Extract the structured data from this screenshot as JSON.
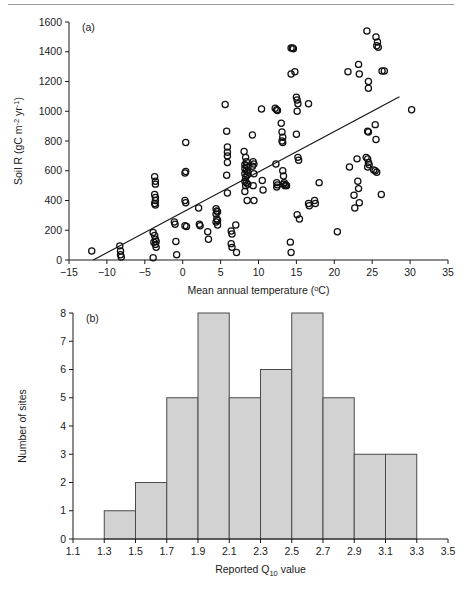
{
  "figure": {
    "panels": [
      "(a)",
      "(b)"
    ]
  },
  "chart_data": [
    {
      "type": "scatter",
      "panel": "(a)",
      "title": "",
      "xlabel": "Mean annual temperature (°C)",
      "ylabel": "Soil R (gC m⁻² yr⁻¹)",
      "ylabel_parts": {
        "main": "Soil R (gC m",
        "sup1": "-2",
        "mid": " yr",
        "sup2": "-1",
        "end": ")"
      },
      "xlabel_parts": {
        "main": "Mean annual temperature (",
        "deg": "o",
        "end": "C)"
      },
      "xlim": [
        -15,
        35
      ],
      "ylim": [
        0,
        1600
      ],
      "xticks": [
        -15,
        -10,
        -5,
        0,
        5,
        10,
        15,
        20,
        25,
        30,
        35
      ],
      "xtick_labels": [
        "−15",
        "−10",
        "−5",
        "0",
        "5",
        "10",
        "15",
        "20",
        "25",
        "30",
        "35"
      ],
      "yticks": [
        0,
        200,
        400,
        600,
        800,
        1000,
        1200,
        1400,
        1600
      ],
      "ytick_labels": [
        "0",
        "200",
        "400",
        "600",
        "800",
        "1000",
        "1200",
        "1400",
        "1600"
      ],
      "grid": false,
      "legend": "none",
      "marker": "open-circle",
      "trendline": {
        "x": [
          -11.8,
          28.6
        ],
        "y": [
          0,
          1098
        ]
      },
      "points": [
        [
          -12.0,
          60
        ],
        [
          -8.3,
          95
        ],
        [
          -8.2,
          60
        ],
        [
          -8.2,
          35
        ],
        [
          -8.1,
          20
        ],
        [
          -3.7,
          560
        ],
        [
          -3.6,
          530
        ],
        [
          -3.6,
          510
        ],
        [
          -3.7,
          440
        ],
        [
          -3.6,
          420
        ],
        [
          -3.6,
          400
        ],
        [
          -3.7,
          380
        ],
        [
          -3.6,
          370
        ],
        [
          -3.9,
          185
        ],
        [
          -3.7,
          165
        ],
        [
          -3.6,
          140
        ],
        [
          -3.5,
          125
        ],
        [
          -3.8,
          120
        ],
        [
          -3.6,
          105
        ],
        [
          -3.5,
          85
        ],
        [
          -3.9,
          15
        ],
        [
          -1.1,
          255
        ],
        [
          -1.0,
          240
        ],
        [
          -0.9,
          125
        ],
        [
          -0.8,
          35
        ],
        [
          0.4,
          790
        ],
        [
          0.4,
          595
        ],
        [
          0.3,
          585
        ],
        [
          0.3,
          400
        ],
        [
          0.4,
          385
        ],
        [
          0.3,
          230
        ],
        [
          0.5,
          225
        ],
        [
          2.1,
          350
        ],
        [
          2.2,
          240
        ],
        [
          2.3,
          230
        ],
        [
          3.3,
          190
        ],
        [
          3.4,
          140
        ],
        [
          4.4,
          345
        ],
        [
          4.5,
          330
        ],
        [
          4.6,
          325
        ],
        [
          4.4,
          310
        ],
        [
          4.5,
          275
        ],
        [
          4.6,
          265
        ],
        [
          4.4,
          255
        ],
        [
          4.6,
          235
        ],
        [
          5.6,
          1045
        ],
        [
          5.8,
          865
        ],
        [
          5.9,
          760
        ],
        [
          5.9,
          725
        ],
        [
          5.9,
          700
        ],
        [
          5.9,
          655
        ],
        [
          5.8,
          570
        ],
        [
          5.9,
          450
        ],
        [
          6.4,
          195
        ],
        [
          6.5,
          175
        ],
        [
          6.4,
          110
        ],
        [
          6.5,
          85
        ],
        [
          7.0,
          235
        ],
        [
          7.1,
          50
        ],
        [
          8.1,
          730
        ],
        [
          8.3,
          690
        ],
        [
          8.4,
          660
        ],
        [
          8.2,
          640
        ],
        [
          8.4,
          635
        ],
        [
          8.6,
          625
        ],
        [
          8.2,
          615
        ],
        [
          8.4,
          600
        ],
        [
          8.6,
          590
        ],
        [
          8.2,
          580
        ],
        [
          8.5,
          570
        ],
        [
          8.3,
          555
        ],
        [
          8.2,
          530
        ],
        [
          8.4,
          520
        ],
        [
          8.6,
          510
        ],
        [
          8.3,
          500
        ],
        [
          8.2,
          460
        ],
        [
          8.5,
          400
        ],
        [
          9.2,
          840
        ],
        [
          9.3,
          660
        ],
        [
          9.4,
          645
        ],
        [
          9.2,
          630
        ],
        [
          9.4,
          580
        ],
        [
          9.3,
          500
        ],
        [
          9.4,
          400
        ],
        [
          10.4,
          1015
        ],
        [
          10.5,
          535
        ],
        [
          10.6,
          470
        ],
        [
          12.2,
          1020
        ],
        [
          12.4,
          1010
        ],
        [
          12.5,
          1005
        ],
        [
          12.3,
          645
        ],
        [
          12.4,
          520
        ],
        [
          12.5,
          505
        ],
        [
          12.4,
          490
        ],
        [
          13.0,
          920
        ],
        [
          13.1,
          860
        ],
        [
          13.2,
          825
        ],
        [
          13.1,
          800
        ],
        [
          13.2,
          790
        ],
        [
          13.2,
          600
        ],
        [
          13.3,
          565
        ],
        [
          13.4,
          520
        ],
        [
          13.3,
          510
        ],
        [
          13.5,
          500
        ],
        [
          13.6,
          505
        ],
        [
          13.7,
          500
        ],
        [
          14.3,
          1425
        ],
        [
          14.5,
          1425
        ],
        [
          14.6,
          1420
        ],
        [
          14.3,
          1250
        ],
        [
          14.8,
          1265
        ],
        [
          14.2,
          120
        ],
        [
          14.3,
          50
        ],
        [
          15.0,
          1095
        ],
        [
          15.1,
          1075
        ],
        [
          15.2,
          1050
        ],
        [
          15.1,
          1000
        ],
        [
          15.0,
          845
        ],
        [
          15.2,
          690
        ],
        [
          15.3,
          670
        ],
        [
          15.1,
          305
        ],
        [
          15.4,
          275
        ],
        [
          16.6,
          1050
        ],
        [
          16.6,
          380
        ],
        [
          16.7,
          365
        ],
        [
          17.4,
          400
        ],
        [
          17.5,
          380
        ],
        [
          18.0,
          520
        ],
        [
          20.4,
          190
        ],
        [
          21.8,
          1265
        ],
        [
          22.0,
          625
        ],
        [
          22.6,
          435
        ],
        [
          22.7,
          350
        ],
        [
          23.2,
          1315
        ],
        [
          23.3,
          1250
        ],
        [
          23.0,
          680
        ],
        [
          23.1,
          530
        ],
        [
          23.2,
          480
        ],
        [
          23.3,
          385
        ],
        [
          24.3,
          1540
        ],
        [
          24.5,
          1200
        ],
        [
          24.5,
          1155
        ],
        [
          24.4,
          865
        ],
        [
          24.5,
          860
        ],
        [
          24.2,
          690
        ],
        [
          24.4,
          680
        ],
        [
          24.5,
          655
        ],
        [
          24.6,
          640
        ],
        [
          24.4,
          625
        ],
        [
          25.5,
          1500
        ],
        [
          25.7,
          1465
        ],
        [
          25.6,
          1440
        ],
        [
          25.8,
          1430
        ],
        [
          25.4,
          910
        ],
        [
          25.5,
          810
        ],
        [
          25.2,
          605
        ],
        [
          25.4,
          600
        ],
        [
          25.6,
          590
        ],
        [
          26.3,
          1270
        ],
        [
          26.6,
          1270
        ],
        [
          26.2,
          440
        ],
        [
          30.2,
          1010
        ]
      ]
    },
    {
      "type": "bar",
      "panel": "(b)",
      "title": "",
      "xlabel": "Reported Q10 value",
      "xlabel_parts": {
        "main": "Reported Q",
        "sub": "10",
        "end": " value"
      },
      "ylabel": "Number of sites",
      "xlim": [
        1.1,
        3.5
      ],
      "ylim": [
        0,
        8
      ],
      "xticks": [
        1.1,
        1.3,
        1.5,
        1.7,
        1.9,
        2.1,
        2.3,
        2.5,
        2.7,
        2.9,
        3.1,
        3.3,
        3.5
      ],
      "xtick_labels": [
        "1.1",
        "1.3",
        "1.5",
        "1.7",
        "1.9",
        "2.1",
        "2.3",
        "2.5",
        "2.7",
        "2.9",
        "3.1",
        "3.3",
        "3.5"
      ],
      "yticks": [
        0,
        1,
        2,
        3,
        4,
        5,
        6,
        7,
        8
      ],
      "ytick_labels": [
        "0",
        "1",
        "2",
        "3",
        "4",
        "5",
        "6",
        "7",
        "8"
      ],
      "grid": false,
      "legend": "none",
      "bin_width": 0.2,
      "bin_starts": [
        1.3,
        1.5,
        1.7,
        1.9,
        2.1,
        2.3,
        2.5,
        2.7,
        2.9,
        3.1
      ],
      "categories": [
        "1.3–1.5",
        "1.5–1.7",
        "1.7–1.9",
        "1.9–2.1",
        "2.1–2.3",
        "2.3–2.5",
        "2.5–2.7",
        "2.7–2.9",
        "2.9–3.1",
        "3.1–3.3"
      ],
      "values": [
        1,
        2,
        5,
        8,
        5,
        6,
        8,
        5,
        3,
        3
      ],
      "bar_fill": "#d2d2d2",
      "bar_stroke": "#4a4a4a"
    }
  ]
}
